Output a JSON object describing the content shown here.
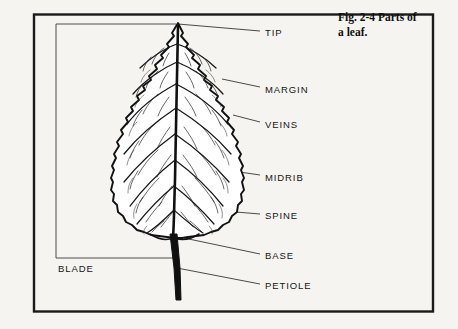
{
  "figure": {
    "caption_line1": "Fig. 2-4  Parts of",
    "caption_line2": "a leaf.",
    "caption_full": "Fig. 2-4  Parts of a leaf.",
    "border_color": "#1a1a1a",
    "ink_color": "#151515",
    "background_color": "#f6f4f1"
  },
  "diagram": {
    "subject": "leaf",
    "bracket_label": "BLADE",
    "labels": [
      {
        "id": "tip",
        "text": "TIP",
        "x": 265,
        "y": 27,
        "leader_from_x": 178,
        "leader_from_y": 24,
        "leader_to_x": 260,
        "leader_to_y": 31
      },
      {
        "id": "margin",
        "text": "MARGIN",
        "x": 265,
        "y": 84,
        "leader_from_x": 222,
        "leader_from_y": 79,
        "leader_to_x": 260,
        "leader_to_y": 87
      },
      {
        "id": "veins",
        "text": "VEINS",
        "x": 265,
        "y": 119,
        "leader_from_x": 233,
        "leader_from_y": 115,
        "leader_to_x": 260,
        "leader_to_y": 122
      },
      {
        "id": "midrib",
        "text": "MIDRIB",
        "x": 265,
        "y": 172,
        "leader_from_x": 178,
        "leader_from_y": 163,
        "leader_to_x": 260,
        "leader_to_y": 175
      },
      {
        "id": "spine",
        "text": "SPINE",
        "x": 265,
        "y": 210,
        "leader_from_x": 175,
        "leader_from_y": 207,
        "leader_to_x": 260,
        "leader_to_y": 214
      },
      {
        "id": "base",
        "text": "BASE",
        "x": 265,
        "y": 250,
        "leader_from_x": 184,
        "leader_from_y": 238,
        "leader_to_x": 260,
        "leader_to_y": 254
      },
      {
        "id": "petiole",
        "text": "PETIOLE",
        "x": 265,
        "y": 280,
        "leader_from_x": 177,
        "leader_from_y": 268,
        "leader_to_x": 260,
        "leader_to_y": 284
      }
    ],
    "blade_bracket": {
      "x": 56,
      "top_y": 24,
      "bottom_y": 258,
      "top_arm_to_x": 176,
      "bottom_arm_to_x": 176,
      "text_x": 58,
      "text_y": 263
    }
  }
}
